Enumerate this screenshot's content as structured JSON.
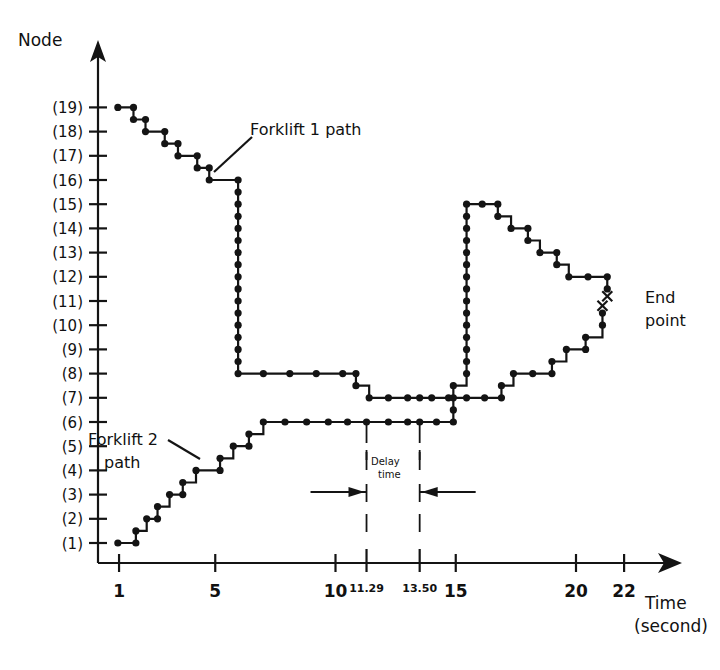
{
  "figure": {
    "y_axis_title": "Node",
    "x_axis_title": "Time",
    "x_axis_subtitle": "(second)",
    "annotations": {
      "forklift1": "Forklift 1 path",
      "forklift2_line1": "Forklift 2",
      "forklift2_line2": "path",
      "endpoint_line1": "End",
      "endpoint_line2": "point",
      "delay_line1": "Delay",
      "delay_line2": "time"
    },
    "ink_color": "#141414"
  },
  "chart_data": {
    "type": "line",
    "title": "",
    "xlabel": "Time (second)",
    "ylabel": "Node",
    "xlim": [
      0,
      23
    ],
    "ylim": [
      0.2,
      20.2
    ],
    "grid": false,
    "legend": "inline annotations",
    "x_ticks": [
      1,
      5,
      10,
      15,
      20,
      22
    ],
    "x_tick_labels": [
      "1",
      "5",
      "10",
      "15",
      "20",
      "22"
    ],
    "x_extra_ticks": [
      11.29,
      13.5
    ],
    "x_extra_tick_labels": [
      "11.29",
      "13.50"
    ],
    "y_ticks": [
      1,
      2,
      3,
      4,
      5,
      6,
      7,
      8,
      9,
      10,
      11,
      12,
      13,
      14,
      15,
      16,
      17,
      18,
      19
    ],
    "y_tick_labels": [
      "(1)",
      "(2)",
      "(3)",
      "(4)",
      "(5)",
      "(6)",
      "(7)",
      "(8)",
      "(9)",
      "(10)",
      "(11)",
      "(12)",
      "(13)",
      "(14)",
      "(15)",
      "(16)",
      "(17)",
      "(18)",
      "(19)"
    ],
    "delay_time": {
      "start": 11.29,
      "end": 13.5,
      "label": "Delay time"
    },
    "series": [
      {
        "name": "Forklift 1 path",
        "marker": "filled-circle",
        "end_marker": "x",
        "points": [
          [
            0.95,
            19
          ],
          [
            1.6,
            19
          ],
          [
            1.6,
            18.5
          ],
          [
            2.1,
            18.5
          ],
          [
            2.1,
            18
          ],
          [
            2.9,
            18
          ],
          [
            2.9,
            17.5
          ],
          [
            3.45,
            17.5
          ],
          [
            3.45,
            17
          ],
          [
            4.25,
            17
          ],
          [
            4.25,
            16.5
          ],
          [
            4.75,
            16.5
          ],
          [
            4.75,
            16
          ],
          [
            5.95,
            16
          ],
          [
            5.95,
            15.5
          ],
          [
            5.95,
            15
          ],
          [
            5.95,
            14.5
          ],
          [
            5.95,
            14
          ],
          [
            5.95,
            13.5
          ],
          [
            5.95,
            13
          ],
          [
            5.95,
            12.5
          ],
          [
            5.95,
            12
          ],
          [
            5.95,
            11.5
          ],
          [
            5.95,
            11
          ],
          [
            5.95,
            10.5
          ],
          [
            5.95,
            10
          ],
          [
            5.95,
            9.5
          ],
          [
            5.95,
            9
          ],
          [
            5.95,
            8.5
          ],
          [
            5.95,
            8
          ],
          [
            7.0,
            8
          ],
          [
            8.1,
            8
          ],
          [
            9.2,
            8
          ],
          [
            10.3,
            8
          ],
          [
            10.85,
            8
          ],
          [
            10.85,
            7.5
          ],
          [
            11.4,
            7
          ],
          [
            12.2,
            7
          ],
          [
            13.0,
            7
          ],
          [
            13.5,
            7
          ],
          [
            14.0,
            7
          ],
          [
            14.7,
            7
          ],
          [
            15.45,
            7
          ],
          [
            16.2,
            7
          ],
          [
            16.9,
            7
          ],
          [
            16.9,
            7.5
          ],
          [
            17.4,
            8
          ],
          [
            18.2,
            8
          ],
          [
            19.0,
            8
          ],
          [
            19.0,
            8.5
          ],
          [
            19.6,
            9
          ],
          [
            20.4,
            9
          ],
          [
            20.4,
            9.5
          ],
          [
            21.1,
            10
          ],
          [
            21.1,
            10.5
          ]
        ],
        "end_point": [
          21.1,
          10.8
        ]
      },
      {
        "name": "Forklift 2 path",
        "marker": "filled-circle",
        "end_marker": "x",
        "points": [
          [
            0.95,
            1
          ],
          [
            1.7,
            1
          ],
          [
            1.7,
            1.5
          ],
          [
            2.15,
            2
          ],
          [
            2.6,
            2
          ],
          [
            2.6,
            2.5
          ],
          [
            3.1,
            3
          ],
          [
            3.65,
            3
          ],
          [
            3.65,
            3.5
          ],
          [
            4.2,
            4
          ],
          [
            5.2,
            4
          ],
          [
            5.2,
            4.5
          ],
          [
            5.75,
            5
          ],
          [
            6.4,
            5
          ],
          [
            6.4,
            5.5
          ],
          [
            7.0,
            6
          ],
          [
            7.9,
            6
          ],
          [
            8.8,
            6
          ],
          [
            9.7,
            6
          ],
          [
            10.5,
            6
          ],
          [
            11.29,
            6
          ],
          [
            12.2,
            6
          ],
          [
            13.0,
            6
          ],
          [
            13.5,
            6
          ],
          [
            14.2,
            6
          ],
          [
            14.9,
            6
          ],
          [
            14.9,
            6.5
          ],
          [
            14.9,
            7
          ],
          [
            14.9,
            7.5
          ],
          [
            15.45,
            8
          ],
          [
            15.45,
            8.5
          ],
          [
            15.45,
            9
          ],
          [
            15.45,
            9.5
          ],
          [
            15.45,
            10
          ],
          [
            15.45,
            10.5
          ],
          [
            15.45,
            11
          ],
          [
            15.45,
            11.5
          ],
          [
            15.45,
            12
          ],
          [
            15.45,
            12.5
          ],
          [
            15.45,
            13
          ],
          [
            15.45,
            13.5
          ],
          [
            15.45,
            14
          ],
          [
            15.45,
            14.5
          ],
          [
            15.45,
            15
          ],
          [
            16.1,
            15
          ],
          [
            16.75,
            15
          ],
          [
            16.75,
            14.5
          ],
          [
            17.3,
            14
          ],
          [
            18.0,
            14
          ],
          [
            18.0,
            13.5
          ],
          [
            18.5,
            13
          ],
          [
            19.2,
            13
          ],
          [
            19.2,
            12.5
          ],
          [
            19.7,
            12
          ],
          [
            20.5,
            12
          ],
          [
            21.3,
            12
          ],
          [
            21.3,
            11.5
          ]
        ],
        "end_point": [
          21.3,
          11.2
        ]
      }
    ]
  }
}
